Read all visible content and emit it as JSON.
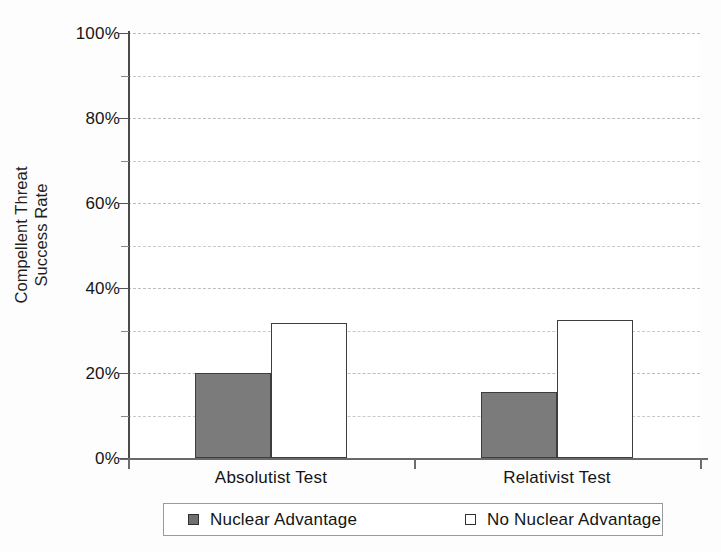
{
  "chart_data": {
    "type": "bar",
    "title": "",
    "xlabel": "",
    "ylabel": "Compellent Threat Success Rate",
    "ylabel_lines": [
      "Compellent Threat",
      "Success Rate"
    ],
    "categories": [
      "Absolutist Test",
      "Relativist Test"
    ],
    "series": [
      {
        "name": "Nuclear Advantage",
        "values": [
          20.0,
          15.5
        ],
        "fill": "#7b7b7b",
        "border": "#3d3d3d"
      },
      {
        "name": "No Nuclear Advantage",
        "values": [
          31.7,
          32.5
        ],
        "fill": "#ffffff",
        "border": "#3d3d3d"
      }
    ],
    "ylim": [
      0,
      100
    ],
    "ytick_labels": [
      "0%",
      "20%",
      "40%",
      "60%",
      "80%",
      "100%"
    ],
    "ytick_values": [
      0,
      20,
      40,
      60,
      80,
      100
    ],
    "yminor_values": [
      10,
      30,
      50,
      70,
      90
    ],
    "grid": true,
    "grid_axis": "y",
    "grid_style": "dashed",
    "grid_color": "#c9c9c9",
    "legend_position": "bottom",
    "legend_entries": [
      "Nuclear Advantage",
      "No Nuclear Advantage"
    ],
    "unit": "%"
  }
}
